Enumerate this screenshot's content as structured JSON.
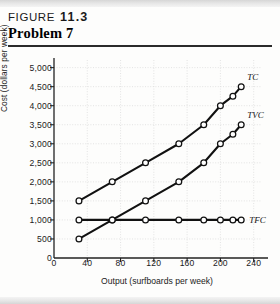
{
  "header": {
    "figure_word": "FIGURE",
    "figure_number": "11.3",
    "problem_title": "Problem 7"
  },
  "chart_data": {
    "type": "line",
    "title": "Problem 7",
    "xlabel": "Output (surfboards per week)",
    "ylabel": "Cost (dollars per week)",
    "xlim": [
      0,
      250
    ],
    "ylim": [
      0,
      5200
    ],
    "xticks": [
      0,
      40,
      80,
      120,
      160,
      200,
      240
    ],
    "xticklabels": [
      "0",
      "40",
      "80",
      "120",
      "160",
      "200",
      "240"
    ],
    "yticks": [
      0,
      500,
      1000,
      1500,
      2000,
      2500,
      3000,
      3500,
      4000,
      4500,
      5000
    ],
    "yticklabels": [
      "0",
      "500",
      "1,000",
      "1,500",
      "2,000",
      "2,500",
      "3,000",
      "3,500",
      "4,000",
      "4,500",
      "5,000"
    ],
    "grid": true,
    "legend_position": "inline-right",
    "marker": "open-circle",
    "series": [
      {
        "name": "TC",
        "label": "TC",
        "color": "#111111",
        "x": [
          30,
          70,
          110,
          150,
          180,
          200,
          215,
          225
        ],
        "values": [
          1500,
          2000,
          2500,
          3000,
          3500,
          4000,
          4250,
          4500
        ]
      },
      {
        "name": "TVC",
        "label": "TVC",
        "color": "#111111",
        "x": [
          30,
          70,
          110,
          150,
          180,
          200,
          215,
          225
        ],
        "values": [
          500,
          1000,
          1500,
          2000,
          2500,
          3000,
          3250,
          3500
        ]
      },
      {
        "name": "TFC",
        "label": "TFC",
        "color": "#111111",
        "x": [
          30,
          70,
          110,
          150,
          180,
          200,
          215,
          225
        ],
        "values": [
          1000,
          1000,
          1000,
          1000,
          1000,
          1000,
          1000,
          1000
        ]
      }
    ]
  }
}
